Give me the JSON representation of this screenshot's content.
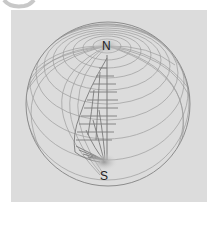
{
  "figure": {
    "type": "sphere-with-dipole-grid-cutaway",
    "labels": {
      "north": "N",
      "south": "S"
    },
    "colors": {
      "panel_background": "#dcdcdc",
      "grid_line": "#8c8c8c",
      "cut_grid_line": "#7a7a7a",
      "pole_shade": "#b4b4b4",
      "label": "#222222"
    }
  }
}
